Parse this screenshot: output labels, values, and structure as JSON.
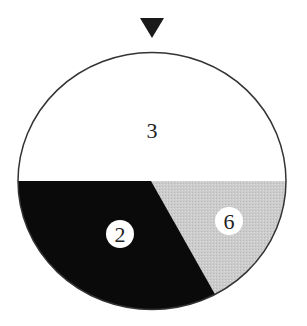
{
  "diagram": {
    "pointer": {
      "shape": "down-triangle",
      "color": "#1a1a1a"
    },
    "wheel": {
      "outline_color": "#333333",
      "sections": [
        {
          "id": "top",
          "label": "3",
          "fill": "#ffffff",
          "badge": false
        },
        {
          "id": "bottom-left",
          "label": "2",
          "fill": "#0a0a0a",
          "badge": true
        },
        {
          "id": "bottom-right",
          "label": "6",
          "fill": "#cfcfcf",
          "badge": true
        }
      ]
    }
  }
}
